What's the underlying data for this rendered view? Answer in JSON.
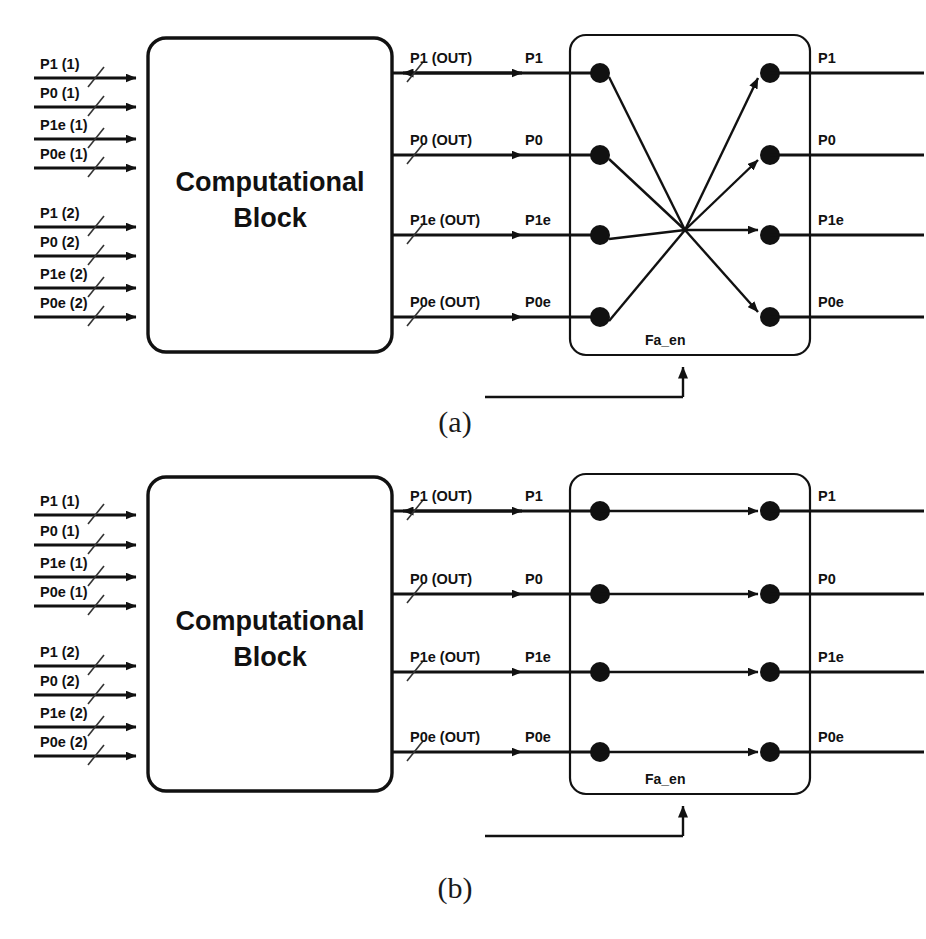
{
  "figure": {
    "captions": [
      {
        "id": "caption-a",
        "text": "(a)",
        "x": 455,
        "y": 432
      },
      {
        "id": "caption-b",
        "text": "(b)",
        "x": 455,
        "y": 898
      }
    ]
  },
  "panels": [
    {
      "id": "panel-a",
      "caption": "(a)",
      "crossbar_mode": "crossed",
      "block": {
        "label_line1": "Computational",
        "label_line2": "Block",
        "x": 148,
        "y": 38,
        "w": 244,
        "h": 314
      },
      "crossbar": {
        "x": 570,
        "y": 35,
        "w": 240,
        "h": 320,
        "enable_label": "Fa_en"
      },
      "inputs": [
        {
          "label": "P1 (1)",
          "y": 78
        },
        {
          "label": "P0 (1)",
          "y": 107
        },
        {
          "label": "P1e (1)",
          "y": 139
        },
        {
          "label": "P0e (1)",
          "y": 168
        },
        {
          "label": "P1 (2)",
          "y": 227
        },
        {
          "label": "P0 (2)",
          "y": 256
        },
        {
          "label": "P1e (2)",
          "y": 288
        },
        {
          "label": "P0e (2)",
          "y": 317
        }
      ],
      "outputs": [
        {
          "out_label": "P1 (OUT)",
          "port_label": "P1",
          "final_label": "P1",
          "y": 73,
          "bidirectional": true
        },
        {
          "out_label": "P0 (OUT)",
          "port_label": "P0",
          "final_label": "P0",
          "y": 155,
          "bidirectional": false
        },
        {
          "out_label": "P1e (OUT)",
          "port_label": "P1e",
          "final_label": "P1e",
          "y": 235,
          "bidirectional": false
        },
        {
          "out_label": "P0e (OUT)",
          "port_label": "P0e",
          "final_label": "P0e",
          "y": 317,
          "bidirectional": false
        }
      ]
    },
    {
      "id": "panel-b",
      "caption": "(b)",
      "crossbar_mode": "straight",
      "block": {
        "label_line1": "Computational",
        "label_line2": "Block",
        "x": 148,
        "y": 477,
        "w": 244,
        "h": 314
      },
      "crossbar": {
        "x": 570,
        "y": 474,
        "w": 240,
        "h": 320,
        "enable_label": "Fa_en"
      },
      "inputs": [
        {
          "label": "P1 (1)",
          "y": 515
        },
        {
          "label": "P0 (1)",
          "y": 545
        },
        {
          "label": "P1e (1)",
          "y": 577
        },
        {
          "label": "P0e (1)",
          "y": 606
        },
        {
          "label": "P1 (2)",
          "y": 666
        },
        {
          "label": "P0 (2)",
          "y": 695
        },
        {
          "label": "P1e (2)",
          "y": 727
        },
        {
          "label": "P0e (2)",
          "y": 756
        }
      ],
      "outputs": [
        {
          "out_label": "P1 (OUT)",
          "port_label": "P1",
          "final_label": "P1",
          "y": 511,
          "bidirectional": true
        },
        {
          "out_label": "P0 (OUT)",
          "port_label": "P0",
          "final_label": "P0",
          "y": 594,
          "bidirectional": false
        },
        {
          "out_label": "P1e (OUT)",
          "port_label": "P1e",
          "final_label": "P1e",
          "y": 672,
          "bidirectional": false
        },
        {
          "out_label": "P0e (OUT)",
          "port_label": "P0e",
          "final_label": "P0e",
          "y": 752,
          "bidirectional": false
        }
      ]
    }
  ],
  "colors": {
    "ink": "#111111",
    "background": "#ffffff"
  }
}
